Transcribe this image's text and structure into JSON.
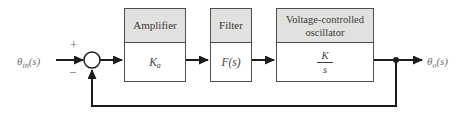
{
  "colors": {
    "background": "#ffffff",
    "block_header_fill": "#e1e1df",
    "block_border": "#4f4f4f",
    "wire": "#1c1c1c",
    "math_text": "#3e3e3e",
    "signal_label_text": "#6e6e6e"
  },
  "diagram": {
    "input_signal": {
      "symbol": "θ",
      "subscript": "in",
      "suffix": "(s)"
    },
    "output_signal": {
      "symbol": "θ",
      "subscript": "o",
      "suffix": "(s)"
    },
    "summing_junction": {
      "plus_sign": "+",
      "minus_sign": "−"
    },
    "blocks": {
      "amplifier": {
        "title": "Amplifier",
        "gain_symbol": "K",
        "gain_subscript": "a"
      },
      "filter": {
        "title": "Filter",
        "tf_symbol": "F",
        "tf_suffix": "(s)"
      },
      "vco": {
        "title_line1": "Voltage-controlled",
        "title_line2": "oscillator",
        "tf_numerator": "K",
        "tf_denominator": "s"
      }
    }
  }
}
